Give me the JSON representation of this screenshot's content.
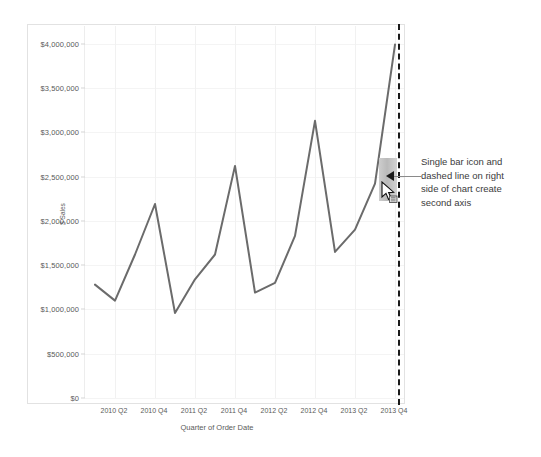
{
  "chart_data": {
    "type": "line",
    "title": "",
    "xlabel": "Quarter of Order Date",
    "ylabel": "$ Sales",
    "ylim": [
      0,
      4200000
    ],
    "grid": true,
    "legend": "none",
    "y_ticks": [
      "$0",
      "$500,000",
      "$1,000,000",
      "$1,500,000",
      "$2,000,000",
      "$2,500,000",
      "$3,000,000",
      "$3,500,000",
      "$4,000,000"
    ],
    "y_tick_values": [
      0,
      500000,
      1000000,
      1500000,
      2000000,
      2500000,
      3000000,
      3500000,
      4000000
    ],
    "x_tick_labels": [
      "2010 Q2",
      "2010 Q4",
      "2011 Q2",
      "2011 Q4",
      "2012 Q2",
      "2012 Q4",
      "2013 Q2",
      "2013 Q4"
    ],
    "categories": [
      "2010 Q1",
      "2010 Q2",
      "2010 Q3",
      "2010 Q4",
      "2011 Q1",
      "2011 Q2",
      "2011 Q3",
      "2011 Q4",
      "2012 Q1",
      "2012 Q2",
      "2012 Q3",
      "2012 Q4",
      "2013 Q1",
      "2013 Q2",
      "2013 Q3",
      "2013 Q4"
    ],
    "series": [
      {
        "name": "$ Sales",
        "color": "#6b6b6b",
        "values": [
          1280000,
          1100000,
          1620000,
          2190000,
          960000,
          1340000,
          1620000,
          2620000,
          1190000,
          1300000,
          1830000,
          3130000,
          1650000,
          1900000,
          2420000,
          3990000
        ]
      }
    ]
  },
  "axis_overlay": {
    "dashed_line_name": "second-axis-drop-line",
    "bar_icon_label": "bar-mark-icon",
    "cursor_label": "drag-cursor"
  },
  "annotation": {
    "lines": [
      "Single bar icon and",
      "dashed line on right",
      "side of chart create",
      "second axis"
    ]
  },
  "colors": {
    "line": "#6b6b6b",
    "grid": "#f1f1f1",
    "border": "#e2e2e2",
    "dashed_axis": "#1a1a1a",
    "text": "#4d4d4d"
  }
}
